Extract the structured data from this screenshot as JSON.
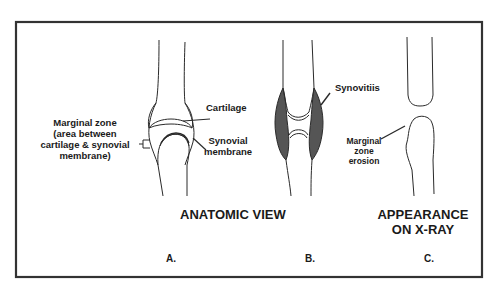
{
  "figure": {
    "title_anatomic": "ANATOMIC VIEW",
    "title_xray_line1": "APPEARANCE",
    "title_xray_line2": "ON X-RAY",
    "panels": [
      {
        "id": "A",
        "label": "A."
      },
      {
        "id": "B",
        "label": "B."
      },
      {
        "id": "C",
        "label": "C."
      }
    ],
    "annotations": {
      "marginal_zone": {
        "line1": "Marginal zone",
        "line2": "(area between",
        "line3": "cartilage & synovial",
        "line4": "membrane)"
      },
      "cartilage": "Cartilage",
      "synovial_line1": "Synovial",
      "synovial_line2": "membrane",
      "synovitis": "Synovitiis",
      "erosion_line1": "Marginal",
      "erosion_line2": "zone",
      "erosion_line3": "erosion"
    },
    "colors": {
      "frame": "#333333",
      "line": "#2a2a2a",
      "synovitis_fill": "#555555",
      "background": "#ffffff"
    }
  }
}
